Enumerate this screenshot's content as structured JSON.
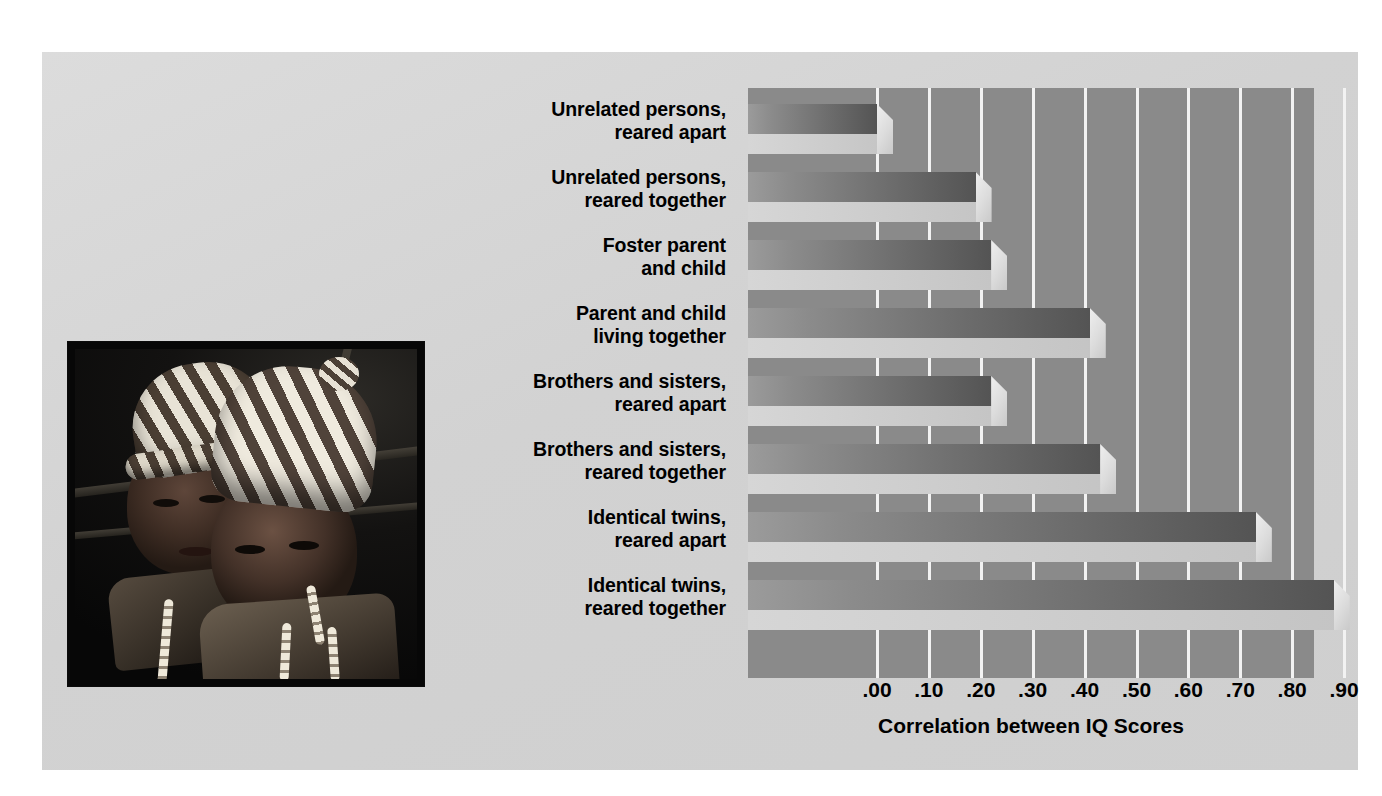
{
  "figure": {
    "background_color": "#d6d6d6",
    "plot_background_color": "#8a8a8a",
    "gridline_color": "#f2f2f2"
  },
  "photo": {
    "alt": "Two infant twins wearing striped knitted caps"
  },
  "chart_data": {
    "type": "bar",
    "orientation": "horizontal",
    "title": "",
    "xlabel": "Correlation between IQ Scores",
    "ylabel": "",
    "xlim": [
      0.0,
      0.93
    ],
    "xticks": [
      ".00",
      ".10",
      ".20",
      ".30",
      ".40",
      ".50",
      ".60",
      ".70",
      ".80",
      ".90"
    ],
    "xtick_values": [
      0.0,
      0.1,
      0.2,
      0.3,
      0.4,
      0.5,
      0.6,
      0.7,
      0.8,
      0.9
    ],
    "grid": true,
    "legend": "none",
    "categories": [
      "Unrelated persons,\nreared apart",
      "Unrelated persons,\nreared together",
      "Foster parent\nand child",
      "Parent and child\nliving together",
      "Brothers and sisters,\nreared apart",
      "Brothers and sisters,\nreared together",
      "Identical twins,\nreared apart",
      "Identical twins,\nreared together"
    ],
    "values": [
      0.0,
      0.19,
      0.22,
      0.41,
      0.22,
      0.43,
      0.73,
      0.88
    ],
    "bars": [
      {
        "label_line1": "Unrelated persons,",
        "label_line2": "reared apart",
        "value": 0.0
      },
      {
        "label_line1": "Unrelated persons,",
        "label_line2": "reared together",
        "value": 0.19
      },
      {
        "label_line1": "Foster parent",
        "label_line2": "and child",
        "value": 0.22
      },
      {
        "label_line1": "Parent and child",
        "label_line2": "living together",
        "value": 0.41
      },
      {
        "label_line1": "Brothers and sisters,",
        "label_line2": "reared apart",
        "value": 0.22
      },
      {
        "label_line1": "Brothers and sisters,",
        "label_line2": "reared together",
        "value": 0.43
      },
      {
        "label_line1": "Identical twins,",
        "label_line2": "reared apart",
        "value": 0.73
      },
      {
        "label_line1": "Identical twins,",
        "label_line2": "reared together",
        "value": 0.88
      }
    ]
  }
}
